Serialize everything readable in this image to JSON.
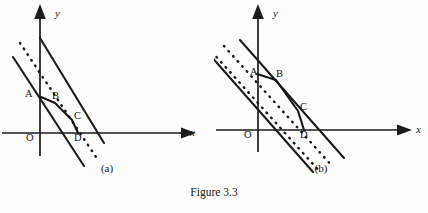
{
  "figure": {
    "caption": "Figure 3.3",
    "background_color": "#fdfdfb",
    "ink_color": "#1b1b1b"
  },
  "panels": [
    {
      "id": "a",
      "subcaption": "(a)",
      "axes": {
        "x_label": "x",
        "y_label": "y",
        "origin_label": "O"
      },
      "points": [
        {
          "label": "A"
        },
        {
          "label": "B"
        },
        {
          "label": "C"
        },
        {
          "label": "D"
        }
      ],
      "geometry": {
        "y_axis": {
          "x": 40,
          "y_top": 8,
          "y_bottom": 156
        },
        "x_axis": {
          "y": 133,
          "x_left": 2,
          "x_right": 196
        },
        "solid_lines": [
          {
            "x1": 40,
            "y1": 38,
            "x2": 104,
            "y2": 143
          },
          {
            "x1": 14,
            "y1": 57,
            "x2": 84,
            "y2": 165
          }
        ],
        "dotted_lines": [
          {
            "x1": 21,
            "y1": 45,
            "x2": 95,
            "y2": 155
          }
        ],
        "path": [
          {
            "x": 41,
            "y": 97,
            "label": "A"
          },
          {
            "x": 55,
            "y": 103,
            "label": "B"
          },
          {
            "x": 72,
            "y": 120,
            "label": "C"
          },
          {
            "x": 78,
            "y": 133,
            "label": "D"
          }
        ]
      }
    },
    {
      "id": "b",
      "subcaption": "(b)",
      "axes": {
        "x_label": "x",
        "y_label": "y",
        "origin_label": "O"
      },
      "points": [
        {
          "label": "A"
        },
        {
          "label": "B"
        },
        {
          "label": "C"
        },
        {
          "label": "D"
        }
      ],
      "geometry": {
        "y_axis": {
          "x": 44,
          "y_top": 8,
          "y_bottom": 152
        },
        "x_axis": {
          "y": 130,
          "x_left": 2,
          "x_right": 198
        },
        "solid_lines": [
          {
            "x1": 26,
            "y1": 40,
            "x2": 130,
            "y2": 158
          },
          {
            "x1": -4,
            "y1": 55,
            "x2": 98,
            "y2": 172
          }
        ],
        "dotted_lines": [
          {
            "x1": 10,
            "y1": 46,
            "x2": 118,
            "y2": 166
          },
          {
            "x1": -2,
            "y1": 52,
            "x2": 106,
            "y2": 172
          }
        ],
        "path": [
          {
            "x": 43,
            "y": 74,
            "label": "A"
          },
          {
            "x": 62,
            "y": 80,
            "label": "B"
          },
          {
            "x": 84,
            "y": 111,
            "label": "C"
          },
          {
            "x": 90,
            "y": 130,
            "label": "D"
          }
        ]
      }
    }
  ]
}
